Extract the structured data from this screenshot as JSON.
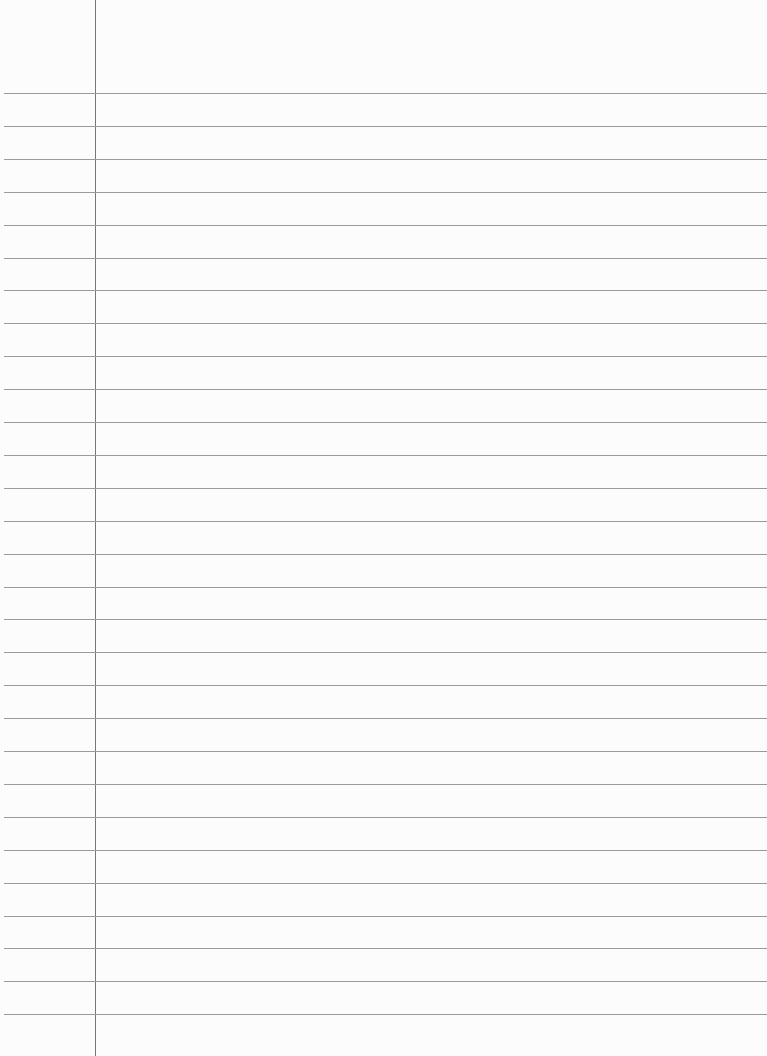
{
  "paper": {
    "type": "lined-paper",
    "background_color": "#fcfcfc",
    "rule_color": "#9a9a9a",
    "margin_color": "#777777",
    "first_rule_y": 93,
    "rule_spacing": 32.9,
    "rule_count": 29,
    "margin_x": 95
  }
}
